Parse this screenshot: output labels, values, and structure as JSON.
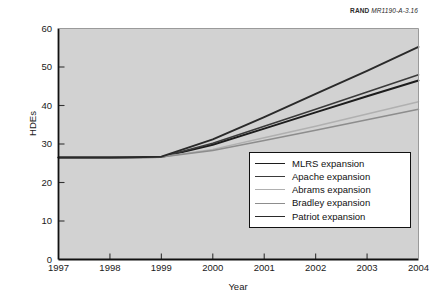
{
  "attribution": {
    "brand": "RAND",
    "code": "MR1190-A-3.16"
  },
  "chart_data": {
    "type": "line",
    "title": "",
    "xlabel": "Year",
    "ylabel": "HDEs",
    "xlim": [
      1997,
      2004
    ],
    "ylim": [
      0,
      60
    ],
    "ytick_labels": [
      "0",
      "10",
      "20",
      "30",
      "40",
      "50",
      "60"
    ],
    "ytick_values": [
      0,
      10,
      20,
      30,
      40,
      50,
      60
    ],
    "xtick_labels": [
      "1997",
      "1998",
      "1999",
      "2000",
      "2001",
      "2002",
      "2003",
      "2004"
    ],
    "xtick_values": [
      1997,
      1998,
      1999,
      2000,
      2001,
      2002,
      2003,
      2004
    ],
    "x": [
      1997,
      1998,
      1999,
      2000,
      2001,
      2002,
      2003,
      2004
    ],
    "grid": false,
    "legend_position": "lower-right",
    "plot_background": "#d2d2d2",
    "series": [
      {
        "name": "MLRS expansion",
        "color": "#1c1c1c",
        "width": 1.9,
        "values": [
          26.5,
          26.5,
          26.6,
          29.8,
          34.0,
          38.2,
          42.4,
          46.5
        ]
      },
      {
        "name": "Apache expansion",
        "color": "#3a3a3a",
        "width": 1.6,
        "values": [
          26.5,
          26.5,
          26.6,
          30.2,
          34.6,
          39.0,
          43.5,
          48.0
        ]
      },
      {
        "name": "Abrams expansion",
        "color": "#b0b0b0",
        "width": 1.5,
        "values": [
          26.5,
          26.5,
          26.6,
          28.6,
          31.6,
          34.6,
          37.8,
          41.0
        ]
      },
      {
        "name": "Bradley expansion",
        "color": "#8d8d8d",
        "width": 1.5,
        "values": [
          26.5,
          26.5,
          26.6,
          28.3,
          30.9,
          33.6,
          36.3,
          39.0
        ]
      },
      {
        "name": "Patriot expansion",
        "color": "#2a2a2a",
        "width": 1.9,
        "values": [
          26.5,
          26.5,
          26.7,
          31.2,
          37.0,
          43.0,
          49.0,
          55.2
        ]
      }
    ]
  }
}
